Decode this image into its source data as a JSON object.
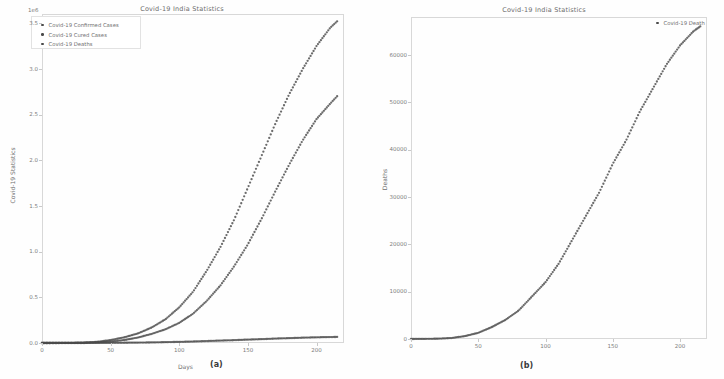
{
  "figure": {
    "caption_a": "(a)",
    "caption_b": "(b)"
  },
  "panel_a": {
    "title": "Covid-19 India Statistics",
    "offset": "1e6",
    "ylabel": "Covid-19 Statistics",
    "xlabel": "Days",
    "yticks": [
      "0.0",
      "0.5",
      "1.0",
      "1.5",
      "2.0",
      "2.5",
      "3.0",
      "3.5"
    ],
    "xticks": [
      "0",
      "50",
      "100",
      "150",
      "200"
    ],
    "legend": [
      "Covid-19 Confirmed Cases",
      "Covid-19 Cured Cases",
      "Covid-19 Deaths"
    ]
  },
  "panel_b": {
    "title": "Covid-19 India Statistics",
    "ylabel": "Deaths",
    "xlabel": "Days",
    "yticks": [
      "0",
      "10000",
      "20000",
      "30000",
      "40000",
      "50000",
      "60000"
    ],
    "xticks": [
      "0",
      "50",
      "100",
      "150",
      "200"
    ],
    "legend": [
      "Covid-19 Death"
    ]
  },
  "colors": {
    "marker": "#4a4a4a",
    "frame": "#d8d8d8",
    "text": "#6d6d6d",
    "background": "#fefefe"
  },
  "chart_data": [
    {
      "type": "scatter",
      "panel": "a",
      "title": "Covid-19 India Statistics",
      "xlabel": "Days",
      "ylabel": "Covid-19 Statistics",
      "y_offset_exponent": "1e6",
      "xlim": [
        0,
        220
      ],
      "ylim": [
        0,
        3.6
      ],
      "xticks": [
        0,
        50,
        100,
        150,
        200
      ],
      "yticks": [
        0.0,
        0.5,
        1.0,
        1.5,
        2.0,
        2.5,
        3.0,
        3.5
      ],
      "grid": false,
      "legend_position": "upper left",
      "x": [
        0,
        10,
        20,
        30,
        40,
        50,
        60,
        70,
        80,
        90,
        100,
        110,
        120,
        130,
        140,
        150,
        160,
        170,
        180,
        190,
        200,
        210,
        215
      ],
      "series": [
        {
          "name": "Covid-19 Confirmed Cases",
          "values": [
            0,
            0.0005,
            0.0015,
            0.004,
            0.012,
            0.032,
            0.062,
            0.105,
            0.17,
            0.26,
            0.39,
            0.56,
            0.79,
            1.05,
            1.35,
            1.7,
            2.05,
            2.4,
            2.72,
            3.0,
            3.25,
            3.45,
            3.52
          ]
        },
        {
          "name": "Covid-19 Cured Cases",
          "values": [
            0,
            0.0002,
            0.0006,
            0.002,
            0.006,
            0.015,
            0.032,
            0.06,
            0.1,
            0.15,
            0.22,
            0.32,
            0.46,
            0.63,
            0.84,
            1.08,
            1.36,
            1.66,
            1.95,
            2.22,
            2.45,
            2.62,
            2.7
          ]
        },
        {
          "name": "Covid-19 Deaths",
          "values": [
            0,
            2e-05,
            6e-05,
            0.0002,
            0.0006,
            0.0013,
            0.0025,
            0.004,
            0.006,
            0.009,
            0.012,
            0.016,
            0.021,
            0.026,
            0.031,
            0.037,
            0.042,
            0.048,
            0.053,
            0.058,
            0.062,
            0.065,
            0.066
          ]
        }
      ]
    },
    {
      "type": "scatter",
      "panel": "b",
      "title": "Covid-19 India Statistics",
      "xlabel": "Days",
      "ylabel": "Deaths",
      "xlim": [
        0,
        220
      ],
      "ylim": [
        0,
        68000
      ],
      "xticks": [
        0,
        50,
        100,
        150,
        200
      ],
      "yticks": [
        0,
        10000,
        20000,
        30000,
        40000,
        50000,
        60000
      ],
      "grid": false,
      "legend_position": "upper right",
      "x": [
        0,
        10,
        20,
        30,
        40,
        50,
        60,
        70,
        80,
        90,
        100,
        110,
        120,
        130,
        140,
        150,
        160,
        170,
        180,
        190,
        200,
        210,
        215
      ],
      "series": [
        {
          "name": "Covid-19 Death",
          "values": [
            0,
            20,
            60,
            200,
            600,
            1300,
            2500,
            4000,
            6000,
            9000,
            12000,
            16000,
            21000,
            26000,
            31000,
            37000,
            42000,
            48000,
            53000,
            58000,
            62000,
            65000,
            66000
          ]
        }
      ]
    }
  ]
}
